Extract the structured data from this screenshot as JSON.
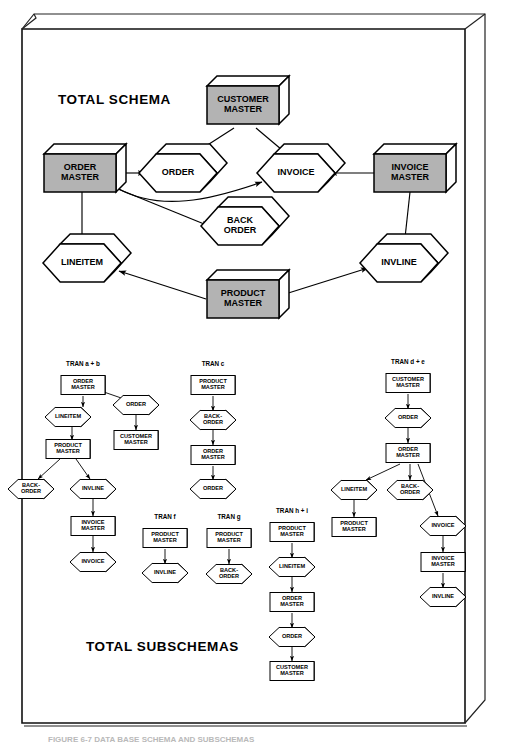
{
  "figure": {
    "caption": "FIGURE 6-7  DATA BASE SCHEMA AND SUBSCHEMAS",
    "section_titles": {
      "schema": "TOTAL SCHEMA",
      "subschemas": "TOTAL SUBSCHEMAS"
    },
    "colors": {
      "master_fill": "#b3b3b3",
      "dataset_fill": "#ffffff",
      "outline": "#000000",
      "page_background": "#ffffff"
    },
    "shape_legend": {
      "box": "master file (3D rectangular box, shaded)",
      "hexagon": "data set / record (3D hexagon, unshaded)"
    }
  },
  "total_schema": {
    "title": "TOTAL SCHEMA",
    "nodes": [
      {
        "id": "customer_master",
        "label": "CUSTOMER MASTER",
        "lines": [
          "CUSTOMER",
          "MASTER"
        ],
        "shape": "box",
        "shaded": true,
        "x": 243,
        "y": 105
      },
      {
        "id": "order_master",
        "label": "ORDER MASTER",
        "lines": [
          "ORDER",
          "MASTER"
        ],
        "shape": "box",
        "shaded": true,
        "x": 80,
        "y": 173
      },
      {
        "id": "order",
        "label": "ORDER",
        "lines": [
          "ORDER"
        ],
        "shape": "hexagon",
        "shaded": false,
        "x": 178,
        "y": 173
      },
      {
        "id": "invoice",
        "label": "INVOICE",
        "lines": [
          "INVOICE"
        ],
        "shape": "hexagon",
        "shaded": false,
        "x": 296,
        "y": 173
      },
      {
        "id": "invoice_master",
        "label": "INVOICE MASTER",
        "lines": [
          "INVOICE",
          "MASTER"
        ],
        "shape": "box",
        "shaded": true,
        "x": 410,
        "y": 173
      },
      {
        "id": "back_order",
        "label": "BACK ORDER",
        "lines": [
          "BACK",
          "ORDER"
        ],
        "shape": "hexagon",
        "shaded": false,
        "x": 240,
        "y": 226
      },
      {
        "id": "lineitem",
        "label": "LINEITEM",
        "lines": [
          "LINEITEM"
        ],
        "shape": "hexagon",
        "shaded": false,
        "x": 82,
        "y": 263
      },
      {
        "id": "invline",
        "label": "INVLINE",
        "lines": [
          "INVLINE"
        ],
        "shape": "hexagon",
        "shaded": false,
        "x": 399,
        "y": 263
      },
      {
        "id": "product_master",
        "label": "PRODUCT MASTER",
        "lines": [
          "PRODUCT",
          "MASTER"
        ],
        "shape": "box",
        "shaded": true,
        "x": 243,
        "y": 299
      }
    ],
    "edges": [
      {
        "from": "customer_master",
        "to": "order"
      },
      {
        "from": "customer_master",
        "to": "invoice"
      },
      {
        "from": "order_master",
        "to": "order"
      },
      {
        "from": "order_master",
        "to": "invoice"
      },
      {
        "from": "order_master",
        "to": "back_order"
      },
      {
        "from": "order_master",
        "to": "lineitem"
      },
      {
        "from": "invoice_master",
        "to": "invoice"
      },
      {
        "from": "invoice_master",
        "to": "invline"
      },
      {
        "from": "product_master",
        "to": "lineitem"
      },
      {
        "from": "product_master",
        "to": "invline"
      }
    ]
  },
  "total_subschemas": {
    "title": "TOTAL SUBSCHEMAS",
    "transactions": [
      {
        "id": "tran_ab",
        "label": "TRAN a + b",
        "label_x": 83,
        "label_y": 366,
        "nodes": [
          {
            "id": "ab_order_master",
            "lines": [
              "ORDER",
              "MASTER"
            ],
            "shape": "box",
            "x": 83,
            "y": 385
          },
          {
            "id": "ab_order",
            "lines": [
              "ORDER"
            ],
            "shape": "hexagon",
            "x": 136,
            "y": 405
          },
          {
            "id": "ab_lineitem",
            "lines": [
              "LINEITEM"
            ],
            "shape": "hexagon",
            "x": 68,
            "y": 417
          },
          {
            "id": "ab_customer_master",
            "lines": [
              "CUSTOMER",
              "MASTER"
            ],
            "shape": "box",
            "x": 136,
            "y": 440
          },
          {
            "id": "ab_product_master",
            "lines": [
              "PRODUCT",
              "MASTER"
            ],
            "shape": "box",
            "x": 68,
            "y": 449
          },
          {
            "id": "ab_back_order",
            "lines": [
              "BACK-",
              "ORDER"
            ],
            "shape": "hexagon",
            "x": 31,
            "y": 489
          },
          {
            "id": "ab_invline",
            "lines": [
              "INVLINE"
            ],
            "shape": "hexagon",
            "x": 93,
            "y": 489
          },
          {
            "id": "ab_invoice_master",
            "lines": [
              "INVOICE",
              "MASTER"
            ],
            "shape": "box",
            "x": 93,
            "y": 526
          },
          {
            "id": "ab_invoice",
            "lines": [
              "INVOICE"
            ],
            "shape": "hexagon",
            "x": 93,
            "y": 562
          }
        ],
        "edges": [
          {
            "from": "ab_order_master",
            "to": "ab_lineitem"
          },
          {
            "from": "ab_order_master",
            "to": "ab_order"
          },
          {
            "from": "ab_order",
            "to": "ab_customer_master"
          },
          {
            "from": "ab_lineitem",
            "to": "ab_product_master"
          },
          {
            "from": "ab_product_master",
            "to": "ab_back_order"
          },
          {
            "from": "ab_product_master",
            "to": "ab_invline"
          },
          {
            "from": "ab_invline",
            "to": "ab_invoice_master"
          },
          {
            "from": "ab_invoice_master",
            "to": "ab_invoice"
          }
        ]
      },
      {
        "id": "tran_c",
        "label": "TRAN c",
        "label_x": 213,
        "label_y": 366,
        "nodes": [
          {
            "id": "c_product_master",
            "lines": [
              "PRODUCT",
              "MASTER"
            ],
            "shape": "box",
            "x": 213,
            "y": 385
          },
          {
            "id": "c_back_order",
            "lines": [
              "BACK-",
              "ORDER"
            ],
            "shape": "hexagon",
            "x": 213,
            "y": 420
          },
          {
            "id": "c_order_master",
            "lines": [
              "ORDER",
              "MASTER"
            ],
            "shape": "box",
            "x": 213,
            "y": 455
          },
          {
            "id": "c_order",
            "lines": [
              "ORDER"
            ],
            "shape": "hexagon",
            "x": 213,
            "y": 489
          }
        ],
        "edges": [
          {
            "from": "c_product_master",
            "to": "c_back_order"
          },
          {
            "from": "c_back_order",
            "to": "c_order_master"
          },
          {
            "from": "c_order_master",
            "to": "c_order"
          }
        ]
      },
      {
        "id": "tran_f",
        "label": "TRAN f",
        "label_x": 165,
        "label_y": 519,
        "nodes": [
          {
            "id": "f_product_master",
            "lines": [
              "PRODUCT",
              "MASTER"
            ],
            "shape": "box",
            "x": 165,
            "y": 538
          },
          {
            "id": "f_invline",
            "lines": [
              "INVLINE"
            ],
            "shape": "hexagon",
            "x": 165,
            "y": 573
          }
        ],
        "edges": [
          {
            "from": "f_product_master",
            "to": "f_invline"
          }
        ]
      },
      {
        "id": "tran_g",
        "label": "TRAN g",
        "label_x": 229,
        "label_y": 519,
        "nodes": [
          {
            "id": "g_product_master",
            "lines": [
              "PRODUCT",
              "MASTER"
            ],
            "shape": "box",
            "x": 229,
            "y": 538
          },
          {
            "id": "g_back_order",
            "lines": [
              "BACK-",
              "ORDER"
            ],
            "shape": "hexagon",
            "x": 229,
            "y": 574
          }
        ],
        "edges": [
          {
            "from": "g_product_master",
            "to": "g_back_order"
          }
        ]
      },
      {
        "id": "tran_hi",
        "label": "TRAN h + i",
        "label_x": 292,
        "label_y": 513,
        "nodes": [
          {
            "id": "hi_product_master",
            "lines": [
              "PRODUCT",
              "MASTER"
            ],
            "shape": "box",
            "x": 292,
            "y": 532
          },
          {
            "id": "hi_lineitem",
            "lines": [
              "LINEITEM"
            ],
            "shape": "hexagon",
            "x": 292,
            "y": 567
          },
          {
            "id": "hi_order_master",
            "lines": [
              "ORDER",
              "MASTER"
            ],
            "shape": "box",
            "x": 292,
            "y": 602
          },
          {
            "id": "hi_order",
            "lines": [
              "ORDER"
            ],
            "shape": "hexagon",
            "x": 292,
            "y": 637
          },
          {
            "id": "hi_customer_master",
            "lines": [
              "CUSTOMER",
              "MASTER"
            ],
            "shape": "box",
            "x": 292,
            "y": 671
          }
        ],
        "edges": [
          {
            "from": "hi_product_master",
            "to": "hi_lineitem"
          },
          {
            "from": "hi_lineitem",
            "to": "hi_order_master"
          },
          {
            "from": "hi_order_master",
            "to": "hi_order"
          },
          {
            "from": "hi_order",
            "to": "hi_customer_master"
          }
        ]
      },
      {
        "id": "tran_de",
        "label": "TRAN d + e",
        "label_x": 408,
        "label_y": 364,
        "nodes": [
          {
            "id": "de_customer_master",
            "lines": [
              "CUSTOMER",
              "MASTER"
            ],
            "shape": "box",
            "x": 408,
            "y": 383
          },
          {
            "id": "de_order",
            "lines": [
              "ORDER"
            ],
            "shape": "hexagon",
            "x": 408,
            "y": 418
          },
          {
            "id": "de_order_master",
            "lines": [
              "ORDER",
              "MASTER"
            ],
            "shape": "box",
            "x": 408,
            "y": 453
          },
          {
            "id": "de_lineitem",
            "lines": [
              "LINEITEM"
            ],
            "shape": "hexagon",
            "x": 354,
            "y": 490
          },
          {
            "id": "de_back_order",
            "lines": [
              "BACK-",
              "ORDER"
            ],
            "shape": "hexagon",
            "x": 410,
            "y": 490
          },
          {
            "id": "de_product_master",
            "lines": [
              "PRODUCT",
              "MASTER"
            ],
            "shape": "box",
            "x": 354,
            "y": 527
          },
          {
            "id": "de_invoice",
            "lines": [
              "INVOICE"
            ],
            "shape": "hexagon",
            "x": 443,
            "y": 526
          },
          {
            "id": "de_invoice_master",
            "lines": [
              "INVOICE",
              "MASTER"
            ],
            "shape": "box",
            "x": 443,
            "y": 562
          },
          {
            "id": "de_invline",
            "lines": [
              "INVLINE"
            ],
            "shape": "hexagon",
            "x": 443,
            "y": 597
          }
        ],
        "edges": [
          {
            "from": "de_customer_master",
            "to": "de_order"
          },
          {
            "from": "de_order",
            "to": "de_order_master"
          },
          {
            "from": "de_order_master",
            "to": "de_lineitem"
          },
          {
            "from": "de_order_master",
            "to": "de_back_order"
          },
          {
            "from": "de_order_master",
            "to": "de_invoice"
          },
          {
            "from": "de_lineitem",
            "to": "de_product_master"
          },
          {
            "from": "de_invoice",
            "to": "de_invoice_master"
          },
          {
            "from": "de_invoice_master",
            "to": "de_invline"
          }
        ]
      }
    ]
  }
}
